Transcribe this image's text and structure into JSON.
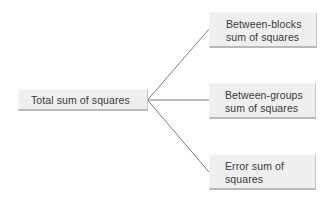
{
  "diagram": {
    "type": "tree",
    "root": {
      "label": "Total sum of squares"
    },
    "children": [
      {
        "line1": "Between-blocks",
        "line2": "sum of squares",
        "label": "Between-blocks sum of squares"
      },
      {
        "line1": "Between-groups",
        "line2": "sum of squares",
        "label": "Between-groups sum of squares"
      },
      {
        "line1": "Error sum of",
        "line2": "squares",
        "label": "Error sum of squares"
      }
    ],
    "colors": {
      "box_fill": "#efefef",
      "box_shadow": "#b9b9b9",
      "text": "#3a3a3a",
      "connector": "#6e6e6e",
      "background": "#ffffff"
    }
  }
}
